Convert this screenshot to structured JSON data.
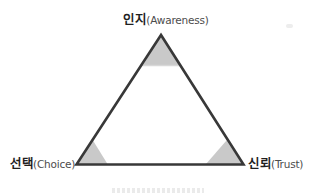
{
  "figure": {
    "description_colors": {
      "background": "#ffffff",
      "triangle_outline": "#383838",
      "corner_shade_fill": "#c9c9c9",
      "apex_divider": "#d8d8d8",
      "korean_text": "#1f1f1f",
      "latin_text": "#4c4c4c"
    },
    "labels": {
      "top": {
        "ko": "인지",
        "en": "(Awareness)"
      },
      "bottom_left": {
        "ko": "선택",
        "en": "(Choice)"
      },
      "bottom_right": {
        "ko": "신뢰",
        "en": "(Trust)"
      }
    }
  }
}
